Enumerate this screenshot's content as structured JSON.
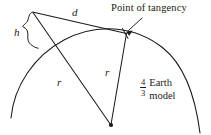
{
  "figure": {
    "labels": {
      "distance_d": "d",
      "height_h": "h",
      "radius_left": "r",
      "radius_right": "r",
      "point_of_tangency": "Point of tangency",
      "earth_model_numerator": "4",
      "earth_model_denominator": "3",
      "earth_model_word_1": "Earth",
      "earth_model_word_2": "model"
    },
    "colors": {
      "stroke": "#1a1a1a",
      "text": "#1a1a1a",
      "background": "#ffffff"
    },
    "geometry": {
      "antenna_apex": [
        32,
        12
      ],
      "point_of_tangency": [
        126,
        33
      ],
      "earth_center": [
        111,
        125
      ],
      "surface_point_below_apex": [
        38,
        48
      ],
      "arc_start": [
        11,
        118
      ],
      "arc_end": [
        200,
        133
      ]
    }
  }
}
